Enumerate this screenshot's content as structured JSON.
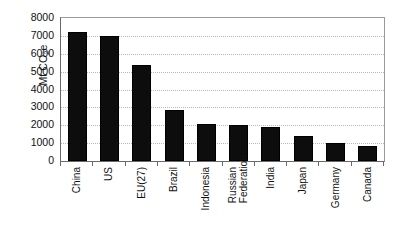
{
  "chart_data": {
    "type": "bar",
    "title": "",
    "subtitle": "",
    "xlabel": "",
    "ylabel": "Mt CO2e",
    "ylabel_parts": {
      "prefix": "Mt CO",
      "sub": "2",
      "suffix": "e"
    },
    "categories": [
      "China",
      "US",
      "EU(27)",
      "Brazil",
      "Indonesia",
      "Russian Federation",
      "India",
      "Japan",
      "Germany",
      "Canada"
    ],
    "category_lines": [
      [
        "China"
      ],
      [
        "US"
      ],
      [
        "EU(27)"
      ],
      [
        "Brazil"
      ],
      [
        "Indonesia"
      ],
      [
        "Russian",
        "Federation"
      ],
      [
        "India"
      ],
      [
        "Japan"
      ],
      [
        "Germany"
      ],
      [
        "Canada"
      ]
    ],
    "values": [
      7200,
      7000,
      5350,
      2850,
      2050,
      2000,
      1900,
      1400,
      1000,
      850
    ],
    "ylim": [
      0,
      8000
    ],
    "ytick_values": [
      8000,
      7000,
      6000,
      5000,
      4000,
      3000,
      2000,
      1000,
      0
    ],
    "ytick_labels": [
      "8000",
      "7000",
      "6000",
      "5000",
      "4000",
      "3000",
      "2000",
      "1000",
      "0"
    ],
    "grid": true,
    "grid_axis": "y",
    "grid_style": "dotted",
    "legend": false,
    "legend_position": "none",
    "bar_color": "#0d0d0d",
    "grid_color": "#b9b9b9",
    "axis_color": "#6a6a6a",
    "frame_color": "#9a9a9a",
    "background": "#ffffff"
  }
}
